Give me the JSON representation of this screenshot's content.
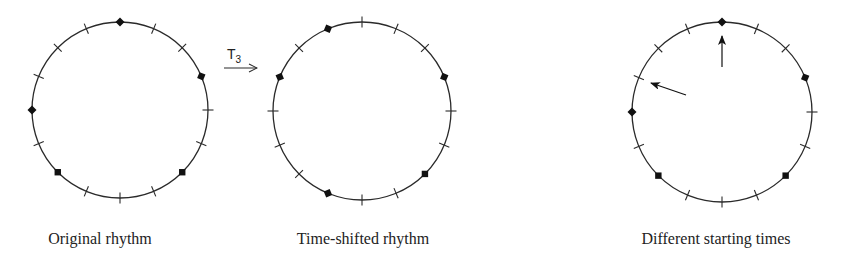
{
  "figure": {
    "positions": 16,
    "colors": {
      "stroke": "#2a2a2a",
      "marker": "#111111",
      "background": "#ffffff"
    },
    "transform": {
      "name": "T",
      "subscript": "3",
      "shift": 3
    },
    "circles": [
      {
        "id": "original",
        "label": "Original rhythm",
        "cx": 120,
        "cy": 110,
        "r": 88,
        "onsets": [
          0,
          3,
          6,
          10,
          12
        ],
        "arrows": []
      },
      {
        "id": "time-shifted",
        "label": "Time-shifted rhythm",
        "cx": 362,
        "cy": 111,
        "r": 89,
        "onsets": [
          3,
          6,
          9,
          13,
          15
        ],
        "arrows": []
      },
      {
        "id": "starting-times",
        "label": "Different starting times",
        "cx": 722,
        "cy": 112,
        "r": 90,
        "onsets": [
          0,
          3,
          6,
          10,
          12
        ],
        "arrows": [
          {
            "points_to_position": 0,
            "x1": 722,
            "y1": 67,
            "x2": 722,
            "y2": 36
          },
          {
            "points_to_position": 13,
            "x1": 686,
            "y1": 95,
            "x2": 651,
            "y2": 83
          }
        ]
      }
    ]
  }
}
